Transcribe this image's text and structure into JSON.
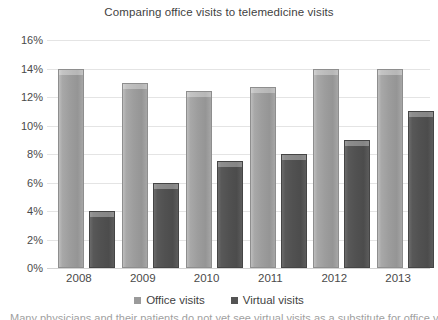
{
  "chart_data": {
    "type": "bar",
    "title": "Comparing office visits to telemedicine visits",
    "xlabel": "",
    "ylabel": "",
    "categories": [
      "2008",
      "2009",
      "2010",
      "2011",
      "2012",
      "2013"
    ],
    "series": [
      {
        "name": "Office visits",
        "color": "#9a9a9a",
        "values": [
          14.0,
          13.0,
          12.4,
          12.7,
          14.0,
          14.0
        ]
      },
      {
        "name": "Virtual visits",
        "color": "#545454",
        "values": [
          4.0,
          6.0,
          7.5,
          8.0,
          9.0,
          11.0
        ]
      }
    ],
    "ylim": [
      0,
      16
    ],
    "ytick_values": [
      0,
      2,
      4,
      6,
      8,
      10,
      12,
      14,
      16
    ],
    "ytick_labels": [
      "0%",
      "2%",
      "4%",
      "6%",
      "8%",
      "10%",
      "12%",
      "14%",
      "16%"
    ],
    "grid": true,
    "legend_position": "bottom"
  },
  "caption": {
    "partial_text": "Many physicians and their patients do not yet see virtual visits as a substitute for office visits"
  }
}
